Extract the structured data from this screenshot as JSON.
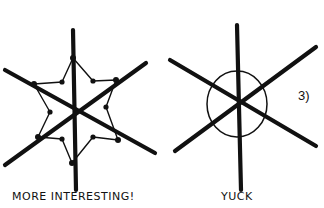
{
  "figures": [
    {
      "id": "left",
      "description": "six-spoke snowflake with zig-zag connecting line and dot nodes",
      "caption": "MORE INTERESTING!",
      "spokes": [
        [
          73,
          30,
          76,
          190
        ],
        [
          5,
          70,
          155,
          153
        ],
        [
          5,
          165,
          146,
          63
        ]
      ],
      "outer_nodes": [
        [
          73,
          58
        ],
        [
          116,
          80
        ],
        [
          118,
          140
        ],
        [
          72,
          163
        ],
        [
          38,
          137
        ],
        [
          34,
          84
        ]
      ],
      "inner_nodes": [
        [
          93,
          81
        ],
        [
          106,
          107
        ],
        [
          93,
          137
        ],
        [
          62,
          139
        ],
        [
          50,
          112
        ],
        [
          62,
          82
        ]
      ]
    },
    {
      "id": "right",
      "description": "six-spoke snowflake with a plain circle",
      "caption": "YUCK",
      "spokes": [
        [
          237,
          25,
          241,
          190
        ],
        [
          170,
          60,
          316,
          146
        ],
        [
          175,
          151,
          316,
          47
        ]
      ],
      "circle": {
        "cx": 237,
        "cy": 104,
        "rx": 30,
        "ry": 33
      }
    }
  ],
  "label": "3)",
  "colors": {
    "ink": "#111111",
    "background": "#ffffff"
  }
}
